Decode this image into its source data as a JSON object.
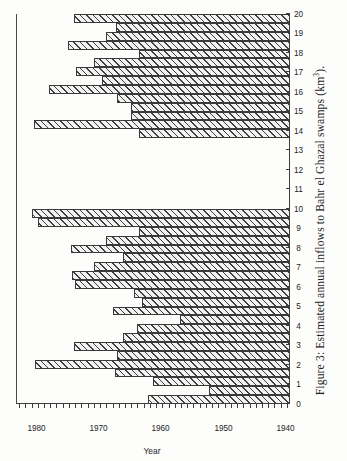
{
  "figure": {
    "caption_prefix": "Figure 3:",
    "caption_text": "Estimated annual inflows to Bahr el Ghazal swamps (km",
    "caption_exponent": "3",
    "caption_suffix": ").",
    "caption_full": "Figure 3: Estimated annual inflows to Bahr el Ghazal swamps (km3)."
  },
  "axes": {
    "x_title": "Year",
    "x_tick_labels": [
      "1940",
      "1950",
      "1960",
      "1970",
      "1980"
    ],
    "y_tick_labels": [
      "0",
      "1",
      "2",
      "3",
      "4",
      "5",
      "6",
      "7",
      "8",
      "9",
      "10",
      "11",
      "12",
      "13",
      "14",
      "15",
      "16",
      "17",
      "18",
      "19",
      "20"
    ],
    "y_label": ""
  },
  "colors": {
    "ink": "#3a3a3a",
    "paper": "#fdfdfc",
    "bar_fill": "#f2f2f0",
    "hatch": "#3f3f3f"
  },
  "chart_data": {
    "type": "bar",
    "orientation": "vertical",
    "title": "",
    "subtitle": "",
    "xlabel": "Year",
    "ylabel": "",
    "unit": "km3",
    "grid": false,
    "legend": null,
    "xlim": [
      1939.5,
      1983.5
    ],
    "ylim": [
      0,
      20
    ],
    "y_tick_interval": 1,
    "x_tick_interval": 10,
    "x_minor_tick_interval": 1,
    "note": "Data gap between 1962 and 1969 (no bars drawn).",
    "categories": [
      1940,
      1941,
      1942,
      1943,
      1944,
      1945,
      1946,
      1947,
      1948,
      1949,
      1950,
      1951,
      1952,
      1953,
      1954,
      1955,
      1956,
      1957,
      1958,
      1959,
      1960,
      1961,
      1962,
      1963,
      1964,
      1965,
      1966,
      1967,
      1968,
      1969,
      1970,
      1971,
      1972,
      1973,
      1974,
      1975,
      1976,
      1977,
      1978,
      1979,
      1980,
      1981,
      1982,
      1983
    ],
    "values": [
      10.4,
      5.9,
      10.0,
      12.8,
      18.6,
      12.6,
      15.8,
      12.2,
      11.2,
      8.0,
      12.9,
      10.8,
      11.4,
      15.7,
      15.9,
      14.3,
      12.2,
      16.0,
      13.4,
      11.0,
      18.4,
      18.8,
      null,
      null,
      null,
      null,
      null,
      null,
      null,
      null,
      11.0,
      18.7,
      11.6,
      11.6,
      12.6,
      17.6,
      13.7,
      15.6,
      14.3,
      11.0,
      16.2,
      13.4,
      12.7,
      15.8
    ]
  }
}
